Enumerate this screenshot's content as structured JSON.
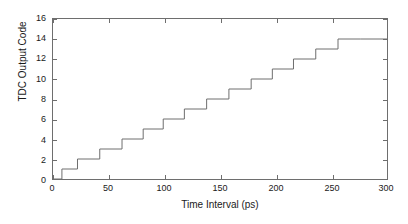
{
  "chart_data": {
    "type": "line",
    "style": "staircase",
    "title": "",
    "xlabel": "Time Interval (ps)",
    "ylabel": "TDC Output Code",
    "xlim": [
      0,
      300
    ],
    "ylim": [
      0,
      16
    ],
    "xticks": [
      0,
      50,
      100,
      150,
      200,
      250,
      300
    ],
    "xticklabels": [
      "0",
      "50",
      "100",
      "150",
      "200",
      "250",
      "300"
    ],
    "yticks": [
      0,
      2,
      4,
      6,
      8,
      10,
      12,
      14,
      16
    ],
    "yticklabels": [
      "0",
      "2",
      "4",
      "6",
      "8",
      "10",
      "12",
      "14",
      "16"
    ],
    "grid": false,
    "legend": null,
    "line_color": "#6e6e6e",
    "line_width": 1,
    "series": [
      {
        "name": "TDC transfer characteristic",
        "x": [
          0,
          8,
          8,
          22,
          22,
          42,
          42,
          62,
          62,
          81,
          81,
          99,
          99,
          118,
          118,
          138,
          138,
          158,
          158,
          178,
          178,
          197,
          197,
          216,
          216,
          236,
          236,
          256,
          256,
          276,
          276,
          300
        ],
        "y": [
          0,
          0,
          1,
          1,
          2,
          2,
          3,
          3,
          4,
          4,
          5,
          5,
          6,
          6,
          7,
          7,
          8,
          8,
          9,
          9,
          10,
          10,
          11,
          11,
          12,
          12,
          13,
          13,
          14,
          14,
          14,
          14
        ],
        "step_edges_ps": [
          8,
          22,
          42,
          62,
          81,
          99,
          118,
          138,
          158,
          178,
          197,
          216,
          236,
          256,
          276
        ],
        "codes": [
          1,
          2,
          3,
          4,
          5,
          6,
          7,
          8,
          9,
          10,
          11,
          12,
          13,
          14
        ]
      }
    ]
  },
  "figure": {
    "background": "#ffffff",
    "axis_color": "#6e6e6e",
    "text_color": "#1a1a1a"
  }
}
